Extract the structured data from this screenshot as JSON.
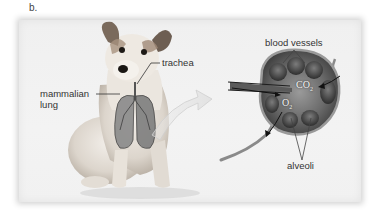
{
  "figure": {
    "panel_label": "b.",
    "labels": {
      "trachea": "trachea",
      "mammalian_lung_line1": "mammalian",
      "mammalian_lung_line2": "lung",
      "blood_vessels": "blood vessels",
      "alveoli": "alveoli"
    },
    "gases": {
      "co2_main": "CO",
      "co2_sub": "2",
      "o2_main": "O",
      "o2_sub": "2"
    },
    "colors": {
      "panel_bg": "#f1f1f1",
      "label_text": "#333333",
      "dog_fur": "#e6e0d8",
      "dog_ears": "#7a6a5c",
      "lung": "#6e6e6e",
      "alveoli_dark": "#4a4a4a",
      "vessel": "#8a8a8a",
      "arrow_fill": "#e4e4e4"
    }
  }
}
